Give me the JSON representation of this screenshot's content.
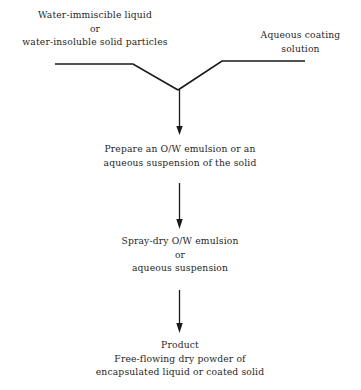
{
  "diagram": {
    "type": "process-flowchart",
    "title_visible": false,
    "background_color": "#ffffff",
    "stroke_color": "#1a1a1a",
    "text_color": "#1f1f1f",
    "inputs": [
      {
        "id": "left-input",
        "lines": [
          "Water-immiscible liquid",
          "or",
          "water-insoluble solid particles"
        ]
      },
      {
        "id": "right-input",
        "lines": [
          "Aqueous coating",
          "solution"
        ]
      }
    ],
    "steps": [
      {
        "id": "prepare",
        "lines": [
          "Prepare an O/W emulsion or an",
          "aqueous suspension of the solid"
        ]
      },
      {
        "id": "spray-dry",
        "lines": [
          "Spray-dry O/W emulsion",
          "or",
          "aqueous suspension"
        ]
      },
      {
        "id": "product",
        "lines": [
          "Product",
          "Free-flowing dry powder of",
          "encapsulated liquid or coated solid"
        ]
      }
    ],
    "connectors": [
      {
        "id": "merge-junction",
        "shape": "y-merge",
        "from": [
          "left-input",
          "right-input"
        ],
        "to": "prepare"
      },
      {
        "id": "arrow-1",
        "shape": "arrow-down",
        "from": "merge-junction",
        "to": "prepare"
      },
      {
        "id": "arrow-2",
        "shape": "arrow-down",
        "from": "prepare",
        "to": "spray-dry"
      },
      {
        "id": "arrow-3",
        "shape": "arrow-down",
        "from": "spray-dry",
        "to": "product"
      }
    ]
  }
}
